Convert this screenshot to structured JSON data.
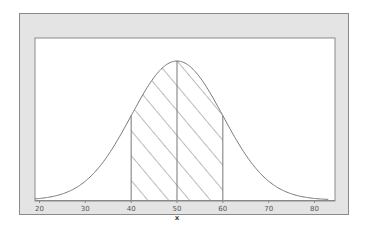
{
  "chart_data": {
    "type": "line",
    "title": "",
    "xlabel": "x",
    "ylabel": "",
    "xlim": [
      19,
      83
    ],
    "x_ticks": [
      20,
      30,
      40,
      50,
      60,
      70,
      80
    ],
    "x_tick_labels": [
      "20",
      "30",
      "40",
      "50",
      "60",
      "70",
      "80"
    ],
    "distribution": "normal",
    "mean": 50,
    "std": 10,
    "shaded_region": {
      "from": 40,
      "to": 60,
      "fill": "hatched"
    },
    "vertical_lines": [
      40,
      50,
      60
    ],
    "grid": false,
    "legend": null,
    "colors": {
      "frame_bg": "#e4e4e4",
      "plot_bg": "#ffffff",
      "curve": "#777777"
    }
  },
  "axis": {
    "x_title": "x",
    "ticks": [
      {
        "value": 20,
        "label": "20"
      },
      {
        "value": 30,
        "label": "30"
      },
      {
        "value": 40,
        "label": "40"
      },
      {
        "value": 50,
        "label": "50"
      },
      {
        "value": 60,
        "label": "60"
      },
      {
        "value": 70,
        "label": "70"
      },
      {
        "value": 80,
        "label": "80"
      }
    ]
  }
}
